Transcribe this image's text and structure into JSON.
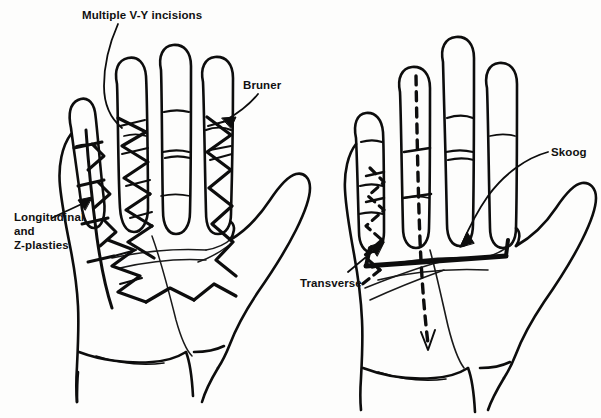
{
  "figure": {
    "background_color": "#fdfdfc",
    "ink_color": "#0d0d0d"
  },
  "labels": {
    "vy_incisions": "Multiple V-Y incisions",
    "bruner": "Bruner",
    "longitudinal_z_plasties": "Longitudinal\nand\nZ-plasties",
    "transverse": "Transverse",
    "skoog": "Skoog"
  },
  "left_hand": {
    "name": "left-palm-diagram",
    "incision_types": [
      "Multiple V-Y incisions",
      "Bruner",
      "Longitudinal and Z-plasties"
    ],
    "line_style": "solid"
  },
  "right_hand": {
    "name": "right-palm-diagram",
    "incision_types": [
      "Transverse",
      "Skoog"
    ],
    "line_style": "dashed and solid"
  }
}
